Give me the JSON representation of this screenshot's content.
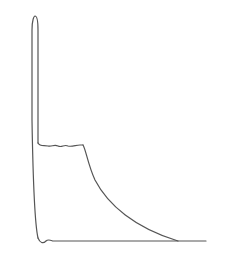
{
  "diagram": {
    "type": "line-drawing",
    "stroke_color": "#555555",
    "background_color": "#ffffff",
    "paths": {
      "spike_outer": "M38,238 C35,225 33,180 32,120 L32,30 C32,20 34,16 35,16 C37,16 38,22 38,30 L38,143",
      "plateau": "M38,143 C40,147 44,145 48,146 C52,147 54,144 58,146 C62,148 64,144 68,146 C72,147 76,145 80,145 L83,145",
      "decay": "M83,145 C86,150 88,165 95,180 C108,205 135,228 178,241",
      "baseline": "M38,238 C40,243 43,244 46,241 C48,239 50,240 53,241 L206,241"
    },
    "key_points": {
      "spike_peak": [
        35,
        16
      ],
      "plateau_start": [
        38,
        143
      ],
      "plateau_end": [
        83,
        145
      ],
      "decay_end": [
        178,
        241
      ],
      "baseline_start": [
        38,
        241
      ],
      "baseline_end": [
        206,
        241
      ]
    }
  }
}
